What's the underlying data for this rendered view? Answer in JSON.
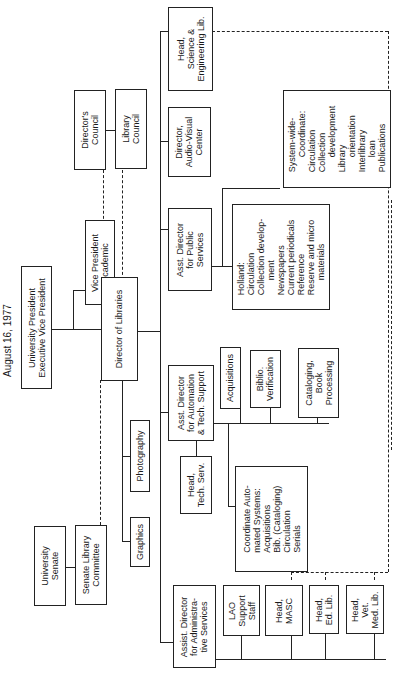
{
  "title": "August 16, 1977",
  "boxes": {
    "university_president": "University President\nExecutive Vice President",
    "vp_academic": "Vice President\nAcademic",
    "director_of_libraries": "Director of Libraries",
    "directors_council": "Director's\nCouncil",
    "library_council": "Library\nCouncil",
    "university_senate": "University\nSenate",
    "senate_library_committee": "Senate Library\nCommittee",
    "graphics": "Graphics",
    "photography": "Photography",
    "head_science_engineering": "Head,\nScience &\nEngineering Lib.",
    "director_audio_visual": "Director,\nAudio-Visual\nCenter",
    "asst_director_public_services": "Asst. Director\nfor Public\nServices",
    "system_wide": "System-wide-\n      Coordinate:\nCirculation\nCollection\n      development\nLibrary\n      orientation\nInterlibrary\n      loan\nPublications",
    "holland": "Holland:\nCirculation\nCollection develop-\n      ment\nNewspapers\nCurrent periodicals\nReference\nReserve and micro\n      materials",
    "asst_director_automation": "Asst. Director\nfor Automation\n& Tech. Support",
    "acquisitions": "Acquisitions",
    "biblio_verification": "Biblio.\nVerification",
    "cataloging": "Cataloging,\nBook\nProcessing",
    "head_tech_serv": "Head,\nTech. Serv.",
    "coordinate_automated": "Coordinate Auto-\nmated Systems:\nAcquisitions\nBib. (Cataloging)\nCirculation\nSerials",
    "asst_director_admin": "Assist. Director\nfor Administra-\ntive Services",
    "lao_support": "LAO\nSupport\nStaff",
    "head_masc": "Head,\nMASC",
    "head_ed_lib": "Head,\nEd. Lib.",
    "head_vet_med": "Head,\nVet.\nMed. Lib."
  }
}
